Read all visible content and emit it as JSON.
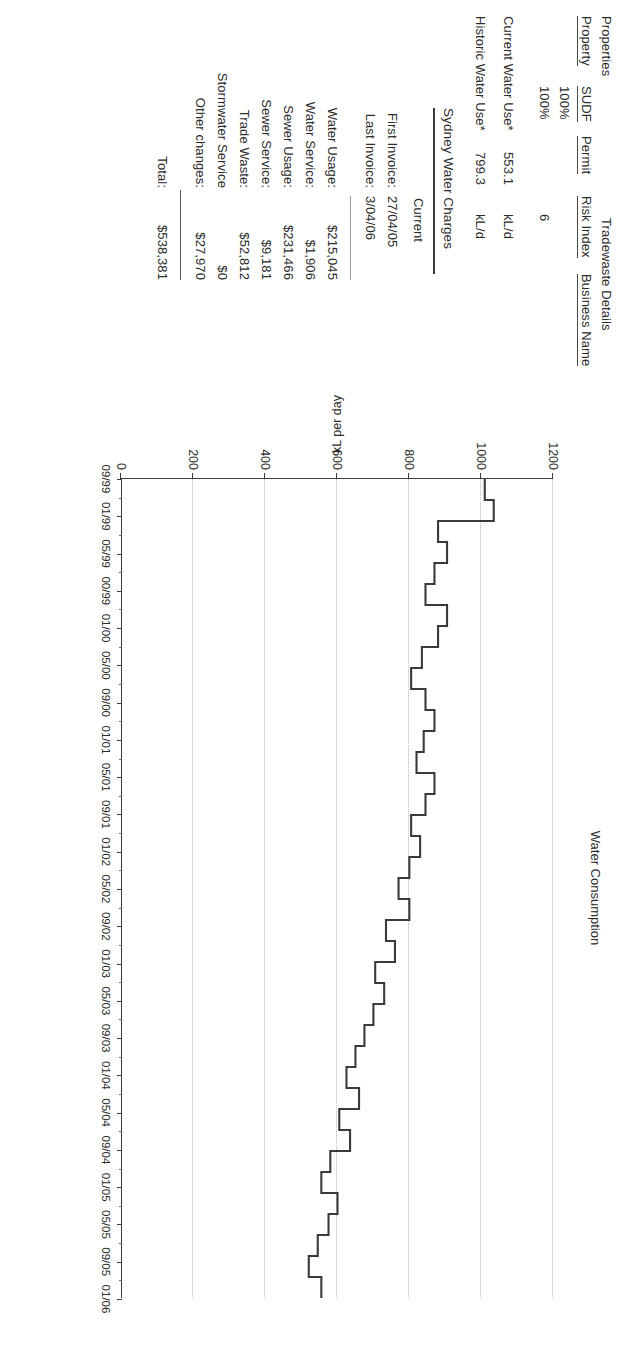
{
  "document": {
    "properties_heading": "Properties",
    "tradewaste_heading": "Tradewaste Details",
    "columns": [
      "Property",
      "SUDF",
      "Permit",
      "Risk Index",
      "Business Name"
    ],
    "rows": [
      {
        "property": "",
        "sudf": "100%",
        "permit": "",
        "risk_index": "",
        "business_name": ""
      },
      {
        "property": "",
        "sudf": "100%",
        "permit": "",
        "risk_index": "6",
        "business_name": ""
      }
    ],
    "usage": [
      {
        "label": "Current Water Use*",
        "value": "553.1",
        "unit": "kL/d"
      },
      {
        "label": "Historic Water Use*",
        "value": "799.3",
        "unit": "kL/d"
      }
    ]
  },
  "charges": {
    "heading": "Sydney Water Charges",
    "column_header": "Current",
    "invoices": [
      {
        "label": "First Invoice:",
        "value": "27/04/05"
      },
      {
        "label": "Last Invoice:",
        "value": "3/04/06"
      }
    ],
    "items": [
      {
        "label": "Water Usage:",
        "value": "$215,045"
      },
      {
        "label": "Water Service:",
        "value": "$1,906"
      },
      {
        "label": "Sewer Usage:",
        "value": "$231,466"
      },
      {
        "label": "Sewer Service:",
        "value": "$9,181"
      },
      {
        "label": "Trade Waste:",
        "value": "$52,812"
      },
      {
        "label": "Stormwater Service",
        "value": "$0"
      },
      {
        "label": "Other changes:",
        "value": "$27,970"
      }
    ],
    "total": {
      "label": "Total:",
      "value": "$538,381"
    }
  },
  "chart_data": {
    "type": "line",
    "title": "Water Consumption",
    "xlabel": "",
    "ylabel": "kL per day",
    "ylim": [
      0,
      1200
    ],
    "yticks": [
      0,
      200,
      400,
      600,
      800,
      1000,
      1200
    ],
    "grid": true,
    "legend": "none",
    "step": "post",
    "xtick_labels": [
      "09/99",
      "01/99",
      "05/99",
      "00/99",
      "01/00",
      "05/00",
      "09/00",
      "01/01",
      "05/01",
      "09/01",
      "01/02",
      "05/02",
      "09/02",
      "01/03",
      "05/03",
      "09/03",
      "01/04",
      "05/04",
      "09/04",
      "01/05",
      "05/05",
      "09/05",
      "01/06"
    ],
    "x": [
      "1999-09",
      "1999-11",
      "2000-01",
      "2000-03",
      "2000-05",
      "2000-07",
      "2000-09",
      "2000-11",
      "2001-01",
      "2001-03",
      "2001-05",
      "2001-07",
      "2001-09",
      "2001-11",
      "2002-01",
      "2002-03",
      "2002-05",
      "2002-07",
      "2002-09",
      "2002-11",
      "2003-01",
      "2003-03",
      "2003-05",
      "2003-07",
      "2003-09",
      "2003-11",
      "2004-01",
      "2004-03",
      "2004-05",
      "2004-07",
      "2004-09",
      "2004-11",
      "2005-01",
      "2005-03",
      "2005-05",
      "2005-07",
      "2005-09",
      "2005-11",
      "2006-01"
    ],
    "series": [
      {
        "name": "Water Consumption",
        "unit": "kL/day",
        "values": [
          1010,
          1035,
          880,
          905,
          870,
          845,
          905,
          880,
          835,
          805,
          845,
          870,
          840,
          820,
          870,
          845,
          805,
          830,
          800,
          770,
          800,
          735,
          760,
          705,
          730,
          700,
          675,
          650,
          625,
          660,
          605,
          635,
          580,
          555,
          600,
          575,
          545,
          520,
          555
        ]
      }
    ],
    "annotations": []
  }
}
